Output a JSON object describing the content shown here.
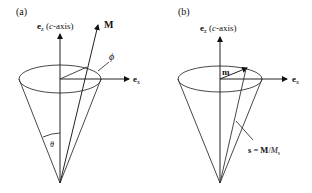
{
  "panels": [
    {
      "id": "a",
      "label": "(a)",
      "axis_z": {
        "bold": "e",
        "sub": "z",
        "rest": " (",
        "italic": "c",
        "rest2": "-axis)"
      },
      "axis_x": {
        "bold": "e",
        "sub": "x"
      },
      "vector": {
        "bold": "M"
      },
      "angle_phi": "ϕ",
      "angle_theta": "θ"
    },
    {
      "id": "b",
      "label": "(b)",
      "axis_z": {
        "bold": "e",
        "sub": "z",
        "rest": " (",
        "italic": "c",
        "rest2": "-axis)"
      },
      "axis_x": {
        "bold": "e",
        "sub": "x"
      },
      "vector": {
        "bold": "m"
      },
      "equation": {
        "s": "s",
        "eq": " = ",
        "M": "M",
        "slash": "/",
        "Ms": "M",
        "sub": "s"
      }
    }
  ]
}
